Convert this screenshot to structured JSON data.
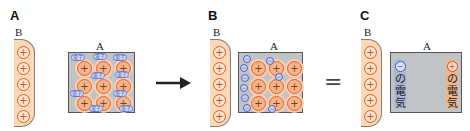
{
  "panels": {
    "a": {
      "label": "A",
      "conductor_b_label": "B",
      "conductor_a_label": "A",
      "b_charges": [
        "+",
        "+",
        "+",
        "+",
        "+"
      ],
      "a_charges": [
        "+",
        "+",
        "+",
        "+",
        "+",
        "+",
        "+",
        "+",
        "+"
      ],
      "electron_tag": "電子"
    },
    "b": {
      "label": "B",
      "conductor_b_label": "B",
      "conductor_a_label": "A",
      "b_charges": [
        "+",
        "+",
        "+",
        "+",
        "+"
      ],
      "a_charges": [
        "+",
        "+",
        "+",
        "+",
        "+",
        "+",
        "+",
        "+",
        "+"
      ],
      "electron_symbol": "−"
    },
    "c": {
      "label": "C",
      "conductor_b_label": "B",
      "conductor_a_label": "A",
      "b_charges": [
        "+",
        "+",
        "+",
        "+",
        "+"
      ],
      "negative_sign": "−",
      "negative_text": [
        "の",
        "電",
        "気"
      ],
      "positive_sign": "+",
      "positive_text": [
        "の",
        "電",
        "気"
      ]
    }
  },
  "connectors": {
    "arrow": "→",
    "equals": "="
  },
  "colors": {
    "conductor_b_fill": "#fbd9b8",
    "conductor_a_fill": "#c0c4c6",
    "positive": "#e05a2a",
    "negative": "#4a63c8",
    "negative_strip": "#aeb6d8",
    "positive_strip": "#f3b58c"
  }
}
